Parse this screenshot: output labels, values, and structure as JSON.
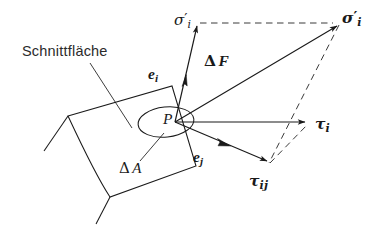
{
  "figure": {
    "title_visible": false,
    "background_color": "#ffffff",
    "line_color": "#1a1a1a",
    "dash_color": "#444444",
    "width": 372,
    "height": 228
  },
  "labels": {
    "surface": "Schnittfläche",
    "point": "P",
    "area_delta": "Δ",
    "area_symbol": "A",
    "force_delta": "Δ",
    "force_symbol": "F",
    "sigma": "σ",
    "tau": "τ",
    "e": "e",
    "sub_i": "i",
    "sub_j": "j",
    "prime": "′"
  },
  "vectors": [
    {
      "name": "sigma-i-prime-normal",
      "label": "σ′i",
      "description": "normal stress vector along surface normal",
      "from": [
        175,
        122
      ],
      "to": [
        197,
        22
      ],
      "style": "solid",
      "arrow": "filled"
    },
    {
      "name": "e-i-unit",
      "label": "ei",
      "description": "unit normal vector, arrowhead partway along sigma prime",
      "from": [
        175,
        122
      ],
      "to": [
        185,
        78
      ],
      "style": "solid",
      "arrow": "filled"
    },
    {
      "name": "delta-F-resultant",
      "label": "ΔF",
      "description": "resultant force vector to upper right corner",
      "from": [
        175,
        122
      ],
      "to": [
        337,
        22
      ],
      "style": "solid",
      "arrow": "filled"
    },
    {
      "name": "tau-i-shear",
      "label": "τi",
      "description": "shear stress vector horizontal to the right",
      "from": [
        175,
        122
      ],
      "to": [
        310,
        122
      ],
      "style": "solid",
      "arrow": "filled"
    },
    {
      "name": "tau-ij-component",
      "label": "τij",
      "description": "shear stress component down and to the right",
      "from": [
        175,
        122
      ],
      "to": [
        270,
        163
      ],
      "style": "solid",
      "arrow": "filled"
    },
    {
      "name": "e-j-unit",
      "label": "ej",
      "description": "unit tangent vector, arrowhead partway along tau ij",
      "from": [
        175,
        122
      ],
      "to": [
        228,
        145
      ],
      "style": "solid",
      "arrow": "filled"
    }
  ],
  "construction_lines": [
    {
      "name": "dash-top-horizontal",
      "from": [
        199,
        23
      ],
      "to": [
        334,
        23
      ],
      "style": "dashed"
    },
    {
      "name": "dash-right-vertical",
      "from": [
        338,
        24
      ],
      "to": [
        268,
        164
      ],
      "style": "dashed"
    },
    {
      "name": "dash-bottom-diagonal",
      "from": [
        269,
        164
      ],
      "to": [
        309,
        123
      ],
      "style": "dashed"
    }
  ],
  "annotations": [
    {
      "name": "surface-leader-line",
      "from": [
        90,
        63
      ],
      "to": [
        132,
        128
      ],
      "description": "leader from Schnittfläche text to cut surface"
    },
    {
      "name": "area-leader-line",
      "from": [
        140,
        160
      ],
      "to": [
        163,
        133
      ],
      "description": "leader from Delta A text to the ellipse"
    }
  ],
  "surface_shape": {
    "name": "cut-surface-patch",
    "description": "quadrilateral patch with curved left edge representing the section plane",
    "outline": "M 68 116 L 172 86 L 196 166 L 110 197 C 96 176 82 146 68 116 Z",
    "edges": [
      {
        "name": "edge-upper-left-tail",
        "path": "M 68 116 L 44 151"
      },
      {
        "name": "edge-lower-left-tail",
        "path": "M 110 197 L 96 224"
      }
    ]
  },
  "ellipse": {
    "name": "delta-a-ellipse",
    "cx": 166,
    "cy": 122,
    "rx": 28,
    "ry": 15,
    "rotation": -6
  }
}
